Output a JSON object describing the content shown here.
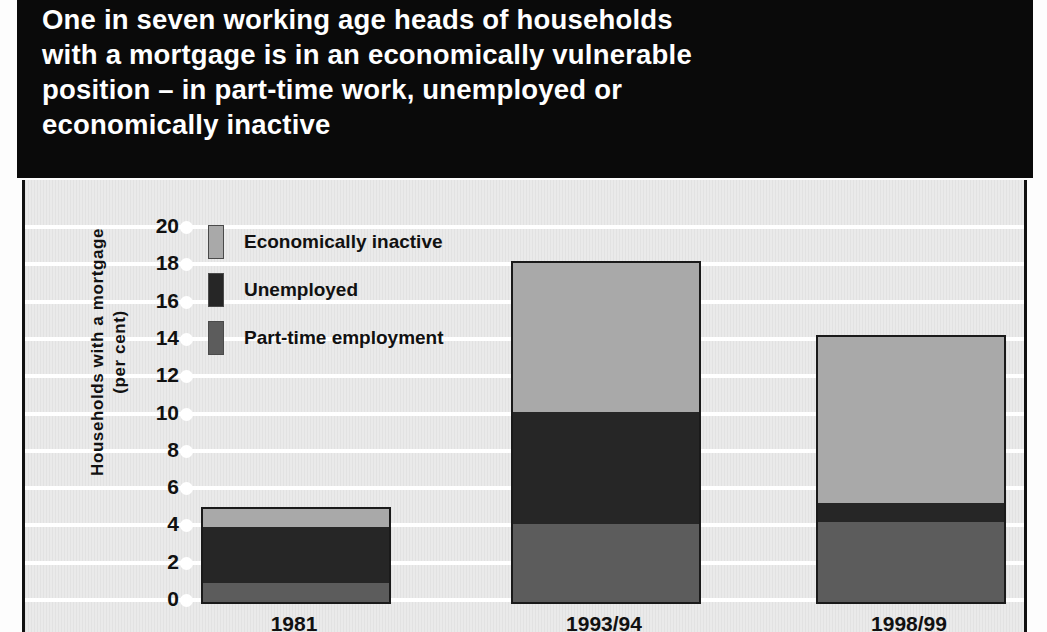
{
  "title": {
    "lines": [
      "One in seven working age heads of households",
      "with a mortgage is in an economically vulnerable",
      "position – in part-time work, unemployed or",
      "economically inactive"
    ]
  },
  "colors": {
    "economically_inactive": "#a9a9a9",
    "unemployed": "#262626",
    "part_time_employment": "#5c5c5c",
    "title_band": "#0a0a0a",
    "plot_background": "#eaeaea",
    "gridline": "#ffffff",
    "axis_text": "#111111",
    "bar_outline": "#1a1a1a"
  },
  "chart_data": {
    "type": "bar",
    "stacked": true,
    "title": "One in seven working age heads of households with a mortgage is in an economically vulnerable position – in part-time work, unemployed or economically inactive",
    "categories": [
      "1981",
      "1993/94",
      "1998/99"
    ],
    "series": [
      {
        "name": "Part-time employment",
        "values": [
          1.0,
          4.2,
          4.3
        ],
        "color": "#5c5c5c"
      },
      {
        "name": "Unemployed",
        "values": [
          3.0,
          6.0,
          1.0
        ],
        "color": "#262626"
      },
      {
        "name": "Economically inactive",
        "values": [
          1.0,
          8.0,
          8.9
        ],
        "color": "#a9a9a9"
      }
    ],
    "totals": [
      5.0,
      18.2,
      14.2
    ],
    "xlabel": "",
    "ylabel": "Households with a mortgage (per cent)",
    "ylim": [
      0,
      20
    ],
    "yticks": [
      0,
      2,
      4,
      6,
      8,
      10,
      12,
      14,
      16,
      18,
      20
    ],
    "ytick_labels": [
      "0",
      "2",
      "4",
      "6",
      "8",
      "10",
      "12",
      "14",
      "16",
      "18",
      "20"
    ],
    "grid": true,
    "legend_position": "upper-left-inside",
    "legend_order": [
      "Economically inactive",
      "Unemployed",
      "Part-time employment"
    ]
  },
  "axis": {
    "y_title_line1": "Households with a mortgage",
    "y_title_line2": "(per cent)"
  }
}
